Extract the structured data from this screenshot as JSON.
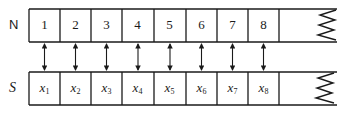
{
  "diagram": {
    "rows": {
      "top": {
        "label": "N",
        "cells": [
          "1",
          "2",
          "3",
          "4",
          "5",
          "6",
          "7",
          "8"
        ]
      },
      "bottom": {
        "label": "S",
        "cells": [
          {
            "base": "x",
            "sub": "1"
          },
          {
            "base": "x",
            "sub": "2"
          },
          {
            "base": "x",
            "sub": "3"
          },
          {
            "base": "x",
            "sub": "4"
          },
          {
            "base": "x",
            "sub": "5"
          },
          {
            "base": "x",
            "sub": "6"
          },
          {
            "base": "x",
            "sub": "7"
          },
          {
            "base": "x",
            "sub": "8"
          }
        ]
      }
    },
    "connector": "double-headed-arrow",
    "continuation": "zigzag-break",
    "colors": {
      "stroke": "#1a1a1a",
      "background": "#ffffff"
    }
  }
}
